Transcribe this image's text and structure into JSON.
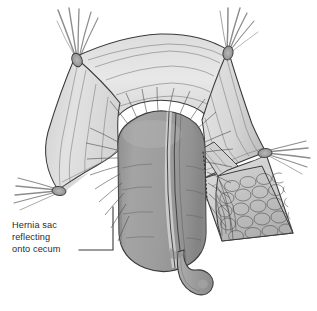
{
  "figure": {
    "kind": "medical-illustration",
    "subject": "Hernia sac reflecting onto cecum",
    "background_color": "#ffffff",
    "ink_color": "#3a3a3a",
    "palette": {
      "background": "#ffffff",
      "sac_membrane_light": "#e4e4e4",
      "sac_membrane_mid": "#d2d2d2",
      "sac_membrane_shadow": "#bdbdbd",
      "cecum_body": "#9b9b9b",
      "cecum_shadow": "#8a8a8a",
      "cecum_highlight": "#b4b4b4",
      "taenia_stripe": "#d6d6d6",
      "appendix": "#9e9e9e",
      "fat_lobule": "#c9c9c9",
      "fat_lobule_dark": "#a8a8a8",
      "suture_thread": "#8d8d8d",
      "outline": "#3a3a3a",
      "label_text": "#2b2b2b",
      "leader_line": "#3a3a3a"
    }
  },
  "annotations": {
    "label_1": {
      "name": "hernia-sac-label",
      "lines": [
        "Hernia sac",
        "reflecting",
        "onto cecum"
      ],
      "text_x": 12,
      "line_y": [
        228,
        240,
        252
      ],
      "leader": {
        "from_x": 79,
        "from_y": 250,
        "elbow_x": 113,
        "elbow_y": 250,
        "to_x": 113,
        "to_y": 207
      }
    }
  },
  "structures": {
    "hernia_sac": {
      "name": "hernia-sac-membrane",
      "description": "Translucent peritoneal sac opened and retracted, held by four traction sutures"
    },
    "cecum": {
      "name": "cecum",
      "description": "Dome of cecum protruding centrally with taenia coli band"
    },
    "appendix": {
      "name": "appendix",
      "description": "Appendix descending from base of cecum with bulbous tip"
    },
    "fatty_tissue": {
      "name": "fatty-lobular-tissue",
      "description": "Cobblestone lobulated fat on right-hand retracted flap"
    },
    "cut_line": {
      "name": "dotted-incision-line",
      "description": "Dotted line marking line of reflection / incision on right of cecum"
    },
    "sutures": [
      {
        "name": "suture-top-left",
        "anchor_x": 75,
        "anchor_y": 57
      },
      {
        "name": "suture-top-right",
        "anchor_x": 228,
        "anchor_y": 50
      },
      {
        "name": "suture-left",
        "anchor_x": 58,
        "anchor_y": 190
      },
      {
        "name": "suture-right",
        "anchor_x": 266,
        "anchor_y": 152
      }
    ]
  }
}
